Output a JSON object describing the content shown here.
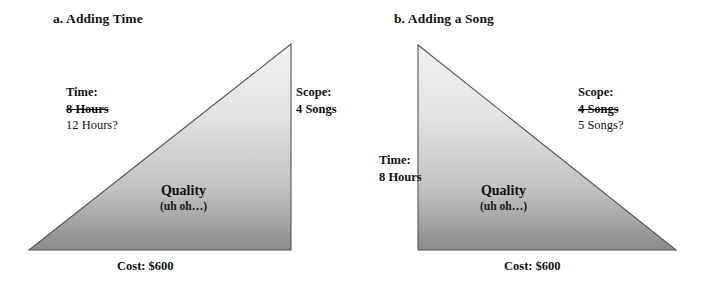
{
  "figure": {
    "background_color": "#ffffff",
    "triangle_fill_top": "#eceaea",
    "triangle_fill_bottom": "#8d8d8d",
    "triangle_edge_color": "#4a4a4a",
    "text_color": "#121212"
  },
  "panels": [
    {
      "id": "a",
      "title": "a. Adding Time",
      "triangle": {
        "shape": "right-triangle",
        "right_angle_corner": "bottom-right",
        "apex": "top-right",
        "points": "29,250 291,250 291,44"
      },
      "time": {
        "heading": "Time:",
        "old_value": "8 Hours",
        "old_value_struck": true,
        "new_value": "12 Hours?"
      },
      "scope": {
        "heading": "Scope:",
        "old_value": "4 Songs",
        "old_value_struck": false,
        "new_value": ""
      },
      "quality": {
        "heading": "Quality",
        "note": "(uh oh…)"
      },
      "cost": "Cost: $600"
    },
    {
      "id": "b",
      "title": "b. Adding a Song",
      "triangle": {
        "shape": "right-triangle",
        "right_angle_corner": "bottom-left",
        "apex": "top-left",
        "points": "64,250 64,45 322,250"
      },
      "time": {
        "heading": "Time:",
        "old_value": "8 Hours",
        "old_value_struck": false,
        "new_value": ""
      },
      "scope": {
        "heading": "Scope:",
        "old_value": "4 Songs",
        "old_value_struck": true,
        "new_value": "5 Songs?"
      },
      "quality": {
        "heading": "Quality",
        "note": "(uh oh…)"
      },
      "cost": "Cost: $600"
    }
  ]
}
